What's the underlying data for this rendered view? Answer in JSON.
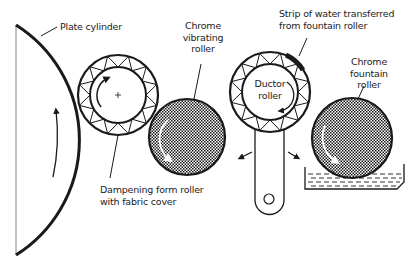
{
  "diagram": {
    "type": "dampening-system-schematic",
    "colors": {
      "line": "#1a1a1a",
      "fill_dark": "#2a2a2a",
      "background": "#ffffff"
    },
    "labels": {
      "plate_cylinder": "Plate cylinder",
      "chrome_vibrating_roller": [
        "Chrome",
        "vibrating",
        "roller"
      ],
      "strip_of_water": [
        "Strip of water transferred",
        "from fountain roller"
      ],
      "ductor_roller": [
        "Ductor",
        "roller"
      ],
      "chrome_fountain_roller": [
        "Chrome",
        "fountain",
        "roller"
      ],
      "dampening_form_roller": [
        "Dampening form roller",
        "with fabric cover"
      ]
    },
    "components": [
      {
        "id": "plate-cylinder",
        "shape": "arc",
        "rotation_arrow": "up"
      },
      {
        "id": "dampening-form-roller",
        "shape": "circle-fabric-cover",
        "rotation_arrow": "clockwise",
        "center_mark": "+"
      },
      {
        "id": "chrome-vibrating-roller",
        "shape": "circle-crosshatch",
        "rotation_arrow": "clockwise"
      },
      {
        "id": "ductor-roller",
        "shape": "circle-fabric-cover-on-arm",
        "rotation_arrow": "clockwise",
        "swing_arrows": [
          "left",
          "right"
        ]
      },
      {
        "id": "chrome-fountain-roller",
        "shape": "circle-crosshatch-in-trough",
        "rotation_arrow": "clockwise"
      },
      {
        "id": "water-fountain-trough",
        "shape": "trough-with-water"
      }
    ]
  }
}
